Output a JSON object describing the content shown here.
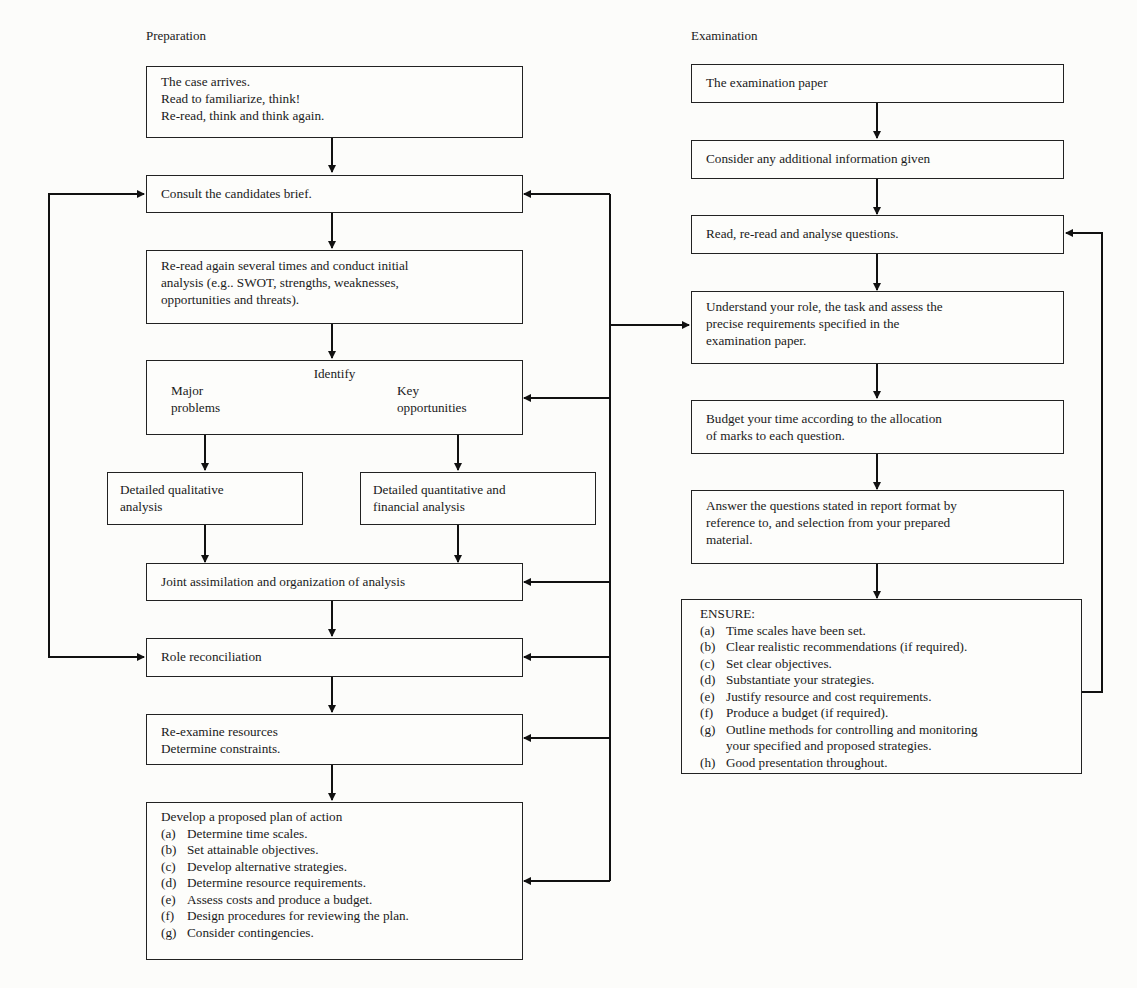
{
  "headings": {
    "preparation": "Preparation",
    "examination": "Examination"
  },
  "preparation": {
    "case_arrives": [
      "The case arrives.",
      "Read to familiarize, think!",
      "Re-read, think and think again."
    ],
    "consult_brief": "Consult the candidates brief.",
    "reread_analysis": [
      "Re-read again several times and conduct initial",
      "analysis (e.g.. SWOT, strengths, weaknesses,",
      "opportunities and threats)."
    ],
    "identify": {
      "title": "Identify",
      "left": [
        "Major",
        "problems"
      ],
      "right": [
        "Key",
        "opportunities"
      ]
    },
    "qualitative": [
      "Detailed qualitative",
      "analysis"
    ],
    "quantitative": [
      "Detailed quantitative and",
      "financial analysis"
    ],
    "joint": "Joint assimilation and organization of analysis",
    "role": "Role reconciliation",
    "reexamine": [
      "Re-examine resources",
      "Determine constraints."
    ],
    "plan": {
      "title": "Develop a proposed plan of action",
      "items": [
        {
          "label": "(a)",
          "text": "Determine time scales."
        },
        {
          "label": "(b)",
          "text": "Set attainable objectives."
        },
        {
          "label": "(c)",
          "text": "Develop alternative strategies."
        },
        {
          "label": "(d)",
          "text": "Determine resource requirements."
        },
        {
          "label": "(e)",
          "text": "Assess costs and produce a budget."
        },
        {
          "label": "(f)",
          "text": "Design procedures for reviewing the plan."
        },
        {
          "label": "(g)",
          "text": "Consider contingencies."
        }
      ]
    }
  },
  "examination": {
    "paper": "The examination paper",
    "additional": "Consider any additional information given",
    "read_questions": "Read, re-read and analyse questions.",
    "understand": [
      "Understand your role, the task and assess the",
      "precise requirements specified in the",
      "examination paper."
    ],
    "budget_time": [
      "Budget your time according to the allocation",
      "of marks to each question."
    ],
    "answer": [
      "Answer the questions stated in report format by",
      "reference to, and selection from your prepared",
      "material."
    ],
    "ensure": {
      "title": "ENSURE:",
      "items": [
        {
          "label": "(a)",
          "text": "Time scales have been set."
        },
        {
          "label": "(b)",
          "text": "Clear realistic recommendations (if required)."
        },
        {
          "label": "(c)",
          "text": "Set clear objectives."
        },
        {
          "label": "(d)",
          "text": "Substantiate your strategies."
        },
        {
          "label": "(e)",
          "text": "Justify resource and cost requirements."
        },
        {
          "label": "(f)",
          "text": "Produce a budget (if required)."
        },
        {
          "label": "(g)",
          "text": "Outline methods for controlling and monitoring",
          "cont": "your specified and proposed strategies."
        },
        {
          "label": "(h)",
          "text": "Good presentation throughout."
        }
      ]
    }
  }
}
